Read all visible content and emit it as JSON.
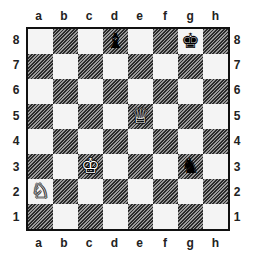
{
  "board": {
    "files": [
      "a",
      "b",
      "c",
      "d",
      "e",
      "f",
      "g",
      "h"
    ],
    "ranks": [
      "8",
      "7",
      "6",
      "5",
      "4",
      "3",
      "2",
      "1"
    ],
    "light_color": "#f4f4f4",
    "dark_style": "hatched",
    "pieces": [
      {
        "square": "d8",
        "color": "black",
        "type": "bishop",
        "glyph": "♝"
      },
      {
        "square": "g8",
        "color": "black",
        "type": "king",
        "glyph": "♚"
      },
      {
        "square": "e5",
        "color": "white",
        "type": "queen",
        "glyph": "♕"
      },
      {
        "square": "c3",
        "color": "white",
        "type": "king",
        "glyph": "♔"
      },
      {
        "square": "g3",
        "color": "black",
        "type": "knight",
        "glyph": "♞"
      },
      {
        "square": "a2",
        "color": "white",
        "type": "knight",
        "glyph": "♘"
      }
    ]
  }
}
